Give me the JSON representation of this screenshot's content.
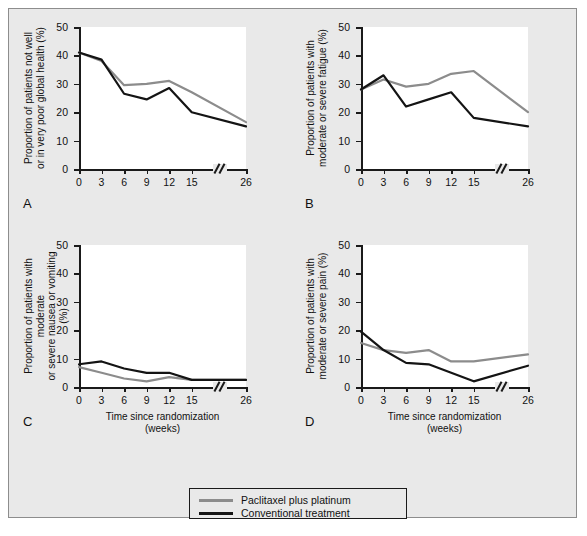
{
  "figure": {
    "background_color": "#e9e9e9",
    "border_color": "#8d8d8d"
  },
  "legend": {
    "position": "bottom-center",
    "entries": [
      {
        "label": "Paclitaxel plus platinum",
        "color": "#8c8c8c"
      },
      {
        "label": "Conventional treatment",
        "color": "#141414"
      }
    ]
  },
  "axis": {
    "xlabel_line1": "Time since randomization",
    "xlabel_line2": "(weeks)",
    "xticks": [
      "0",
      "3",
      "6",
      "9",
      "12",
      "15",
      "26"
    ],
    "yticks": [
      "0",
      "10",
      "20",
      "30",
      "40",
      "50"
    ],
    "break_marker": "//"
  },
  "panels": [
    {
      "letter": "A",
      "ylabel": "Proportion of patients not well\nor in very poor global health (%)"
    },
    {
      "letter": "B",
      "ylabel": "Proportion of patients with\nmoderate or severe fatigue (%)"
    },
    {
      "letter": "C",
      "ylabel": "Proportion of patients with moderate\nor severe nausea or vomiting (%)"
    },
    {
      "letter": "D",
      "ylabel": "Proportion of patients with\nmoderate or severe pain (%)"
    }
  ],
  "chart_data": [
    {
      "type": "line",
      "panel": "A",
      "title": "Proportion of patients not well or in very poor global health (%)",
      "xlabel": "Time since randomization (weeks)",
      "ylabel": "Proportion of patients not well or in very poor global health (%)",
      "x": [
        0,
        3,
        6,
        9,
        12,
        15,
        26
      ],
      "xlim": [
        0,
        26
      ],
      "ylim": [
        0,
        50
      ],
      "grid": false,
      "axis_break_between": [
        15,
        26
      ],
      "series": [
        {
          "name": "Paclitaxel plus platinum",
          "color": "#8c8c8c",
          "values": [
            41,
            38,
            29.5,
            30,
            31,
            27,
            16.5
          ]
        },
        {
          "name": "Conventional treatment",
          "color": "#141414",
          "values": [
            41,
            38.5,
            26.5,
            24.5,
            28.5,
            20,
            15
          ]
        }
      ]
    },
    {
      "type": "line",
      "panel": "B",
      "title": "Proportion of patients with moderate or severe fatigue (%)",
      "xlabel": "Time since randomization (weeks)",
      "ylabel": "Proportion of patients with moderate or severe fatigue (%)",
      "x": [
        0,
        3,
        6,
        9,
        12,
        15,
        26
      ],
      "xlim": [
        0,
        26
      ],
      "ylim": [
        0,
        50
      ],
      "grid": false,
      "axis_break_between": [
        15,
        26
      ],
      "series": [
        {
          "name": "Paclitaxel plus platinum",
          "color": "#8c8c8c",
          "values": [
            28,
            31.5,
            29,
            30,
            33.5,
            34.5,
            20
          ]
        },
        {
          "name": "Conventional treatment",
          "color": "#141414",
          "values": [
            28,
            33,
            22,
            24.5,
            27,
            18,
            15
          ]
        }
      ]
    },
    {
      "type": "line",
      "panel": "C",
      "title": "Proportion of patients with moderate or severe nausea or vomiting (%)",
      "xlabel": "Time since randomization (weeks)",
      "ylabel": "Proportion of patients with moderate or severe nausea or vomiting (%)",
      "x": [
        0,
        3,
        6,
        9,
        12,
        15,
        26
      ],
      "xlim": [
        0,
        26
      ],
      "ylim": [
        0,
        50
      ],
      "grid": false,
      "axis_break_between": [
        15,
        26
      ],
      "series": [
        {
          "name": "Paclitaxel plus platinum",
          "color": "#8c8c8c",
          "values": [
            7,
            5,
            3,
            2,
            3.5,
            2.5,
            2.5
          ]
        },
        {
          "name": "Conventional treatment",
          "color": "#141414",
          "values": [
            8,
            9,
            6.5,
            5,
            5,
            2.5,
            2.5
          ]
        }
      ]
    },
    {
      "type": "line",
      "panel": "D",
      "title": "Proportion of patients with moderate or severe pain (%)",
      "xlabel": "Time since randomization (weeks)",
      "ylabel": "Proportion of patients with moderate or severe pain (%)",
      "x": [
        0,
        3,
        6,
        9,
        12,
        15,
        26
      ],
      "xlim": [
        0,
        26
      ],
      "ylim": [
        0,
        50
      ],
      "grid": false,
      "axis_break_between": [
        15,
        26
      ],
      "series": [
        {
          "name": "Paclitaxel plus platinum",
          "color": "#8c8c8c",
          "values": [
            15.5,
            13,
            12,
            13,
            9,
            9,
            11.5
          ]
        },
        {
          "name": "Conventional treatment",
          "color": "#141414",
          "values": [
            19.5,
            13,
            8.5,
            8,
            5,
            2,
            7.5
          ]
        }
      ]
    }
  ]
}
